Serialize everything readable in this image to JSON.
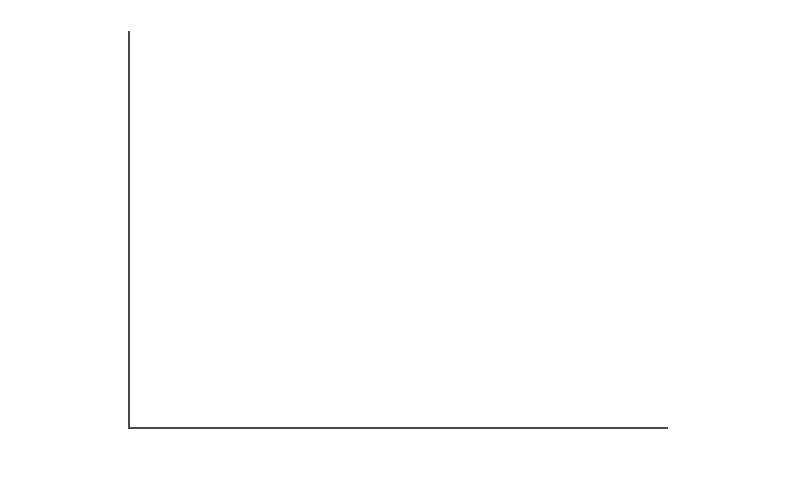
{
  "chart_data": {
    "type": "bar",
    "subtype": "stacked",
    "title": "",
    "xlabel": "",
    "ylabel": "Millions",
    "ylim": [
      0,
      450
    ],
    "ytick_step": 50,
    "ytick_labels": [
      "$450",
      "$400",
      "$350",
      "$300",
      "$250",
      "$200",
      "$150",
      "$100",
      "$50",
      "$0"
    ],
    "ytick_values": [
      450,
      400,
      350,
      300,
      250,
      200,
      150,
      100,
      50,
      0
    ],
    "grid": false,
    "legend_position": "right",
    "categories": [
      "2000 Grant $- Old",
      "2005 Grant $- Old",
      "2000 Grant $- New",
      "2000 Grant $ New"
    ],
    "category_labels": [
      "2000 Grant $- Old",
      "2005 Grant $- Old",
      "2000 Grant $- New",
      "2005 Grant $ New"
    ],
    "legend_groups": [
      {
        "heading": "Old",
        "entries": [
          {
            "name": "Carnegie",
            "color": "#c9c9c9"
          },
          {
            "name": "Ford",
            "color": "#9a9a9a"
          },
          {
            "name": "Annenberg",
            "color": "#4a4a4a"
          }
        ]
      },
      {
        "heading": "New",
        "entries": [
          {
            "name": "Broad",
            "color": "#7e7e7e"
          },
          {
            "name": "Walton",
            "color": "#b9b9b9"
          },
          {
            "name": "Gates",
            "color": "#555555"
          }
        ]
      }
    ],
    "series": [
      {
        "name": "Annenberg",
        "color": "#4a4a4a",
        "values": [
          63,
          46,
          0,
          0
        ]
      },
      {
        "name": "Ford",
        "color": "#9a9a9a",
        "values": [
          22,
          17,
          0,
          0
        ]
      },
      {
        "name": "Carnegie",
        "color": "#c9c9c9",
        "values": [
          22,
          38,
          0,
          0
        ]
      },
      {
        "name": "Gates",
        "color": "#555555",
        "values": [
          0,
          0,
          70,
          282
        ]
      },
      {
        "name": "Walton",
        "color": "#b9b9b9",
        "values": [
          0,
          0,
          0,
          63
        ]
      },
      {
        "name": "Broad",
        "color": "#7e7e7e",
        "values": [
          0,
          0,
          37,
          43
        ]
      }
    ],
    "bar_totals": [
      107,
      101,
      107,
      388
    ],
    "bars": [
      {
        "category": "2000 Grant $- Old",
        "total": 107,
        "segments": [
          {
            "name": "Annenberg",
            "value": 63,
            "color": "#4a4a4a"
          },
          {
            "name": "Ford",
            "value": 22,
            "color": "#9a9a9a"
          },
          {
            "name": "Carnegie",
            "value": 22,
            "color": "#c9c9c9"
          }
        ]
      },
      {
        "category": "2005 Grant $- Old",
        "total": 101,
        "segments": [
          {
            "name": "Annenberg",
            "value": 46,
            "color": "#4a4a4a"
          },
          {
            "name": "Ford",
            "value": 17,
            "color": "#9a9a9a"
          },
          {
            "name": "Carnegie",
            "value": 38,
            "color": "#c9c9c9"
          }
        ]
      },
      {
        "category": "2000 Grant $- New",
        "total": 107,
        "segments": [
          {
            "name": "Gates",
            "value": 70,
            "color": "#555555"
          },
          {
            "name": "Walton",
            "value": 0,
            "color": "#b9b9b9"
          },
          {
            "name": "Broad",
            "value": 37,
            "color": "#7e7e7e"
          }
        ]
      },
      {
        "category": "2005 Grant $ New",
        "total": 388,
        "segments": [
          {
            "name": "Gates",
            "value": 282,
            "color": "#555555"
          },
          {
            "name": "Walton",
            "value": 63,
            "color": "#b9b9b9"
          },
          {
            "name": "Broad",
            "value": 43,
            "color": "#7e7e7e"
          }
        ]
      }
    ]
  },
  "layout": {
    "baseline_y": 427,
    "top_y": 33,
    "plot_left": 128,
    "plot_right": 668,
    "bar_x": [
      152,
      285,
      422,
      557
    ],
    "bar_width": [
      86,
      84,
      83,
      95
    ],
    "axis_color": "#4a4a4a"
  }
}
